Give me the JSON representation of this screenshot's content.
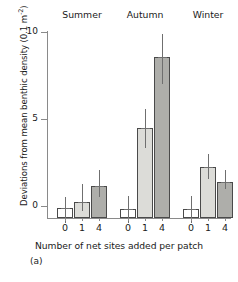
{
  "chart_data": {
    "type": "bar",
    "title": "",
    "panel_label": "(a)",
    "xlabel": "Number of net sites added per patch",
    "ylabel": "Deviations from mean benthic density (0.1 m",
    "ylabel_exponent": "-2",
    "ylabel_suffix": ")",
    "ylim": [
      -1.2,
      10.3
    ],
    "yticks": [
      0,
      5,
      10
    ],
    "ytick_labels": [
      "0",
      "5",
      "10"
    ],
    "grid": false,
    "legend": "none",
    "categories": [
      "0",
      "1",
      "4"
    ],
    "group_labels": [
      "Summer",
      "Autumn",
      "Winter"
    ],
    "groups": [
      {
        "name": "Summer",
        "bars": [
          {
            "category": "0",
            "value": -0.1,
            "err_low": -0.95,
            "err_high": 0.5,
            "fill": "white"
          },
          {
            "category": "1",
            "value": 0.25,
            "err_low": -0.3,
            "err_high": 1.25,
            "fill": "light"
          },
          {
            "category": "4",
            "value": 1.15,
            "err_low": 0.5,
            "err_high": 2.05,
            "fill": "dark"
          }
        ]
      },
      {
        "name": "Autumn",
        "bars": [
          {
            "category": "0",
            "value": -0.15,
            "err_low": -1.0,
            "err_high": 0.55,
            "fill": "white"
          },
          {
            "category": "1",
            "value": 4.45,
            "err_low": 3.3,
            "err_high": 5.55,
            "fill": "light"
          },
          {
            "category": "4",
            "value": 8.55,
            "err_low": 7.0,
            "err_high": 9.85,
            "fill": "dark"
          }
        ]
      },
      {
        "name": "Winter",
        "bars": [
          {
            "category": "0",
            "value": -0.2,
            "err_low": -1.0,
            "err_high": 0.55,
            "fill": "white"
          },
          {
            "category": "1",
            "value": 2.25,
            "err_low": 1.55,
            "err_high": 3.0,
            "fill": "light"
          },
          {
            "category": "4",
            "value": 1.35,
            "err_low": 0.95,
            "err_high": 2.05,
            "fill": "dark"
          }
        ]
      }
    ],
    "colors": {
      "white": "#ffffff",
      "light": "#dcdcd8",
      "dark": "#aeaeaa",
      "outline": "#4a4a4a",
      "axis": "#8a8a8a",
      "text": "#1a1a1a"
    }
  }
}
